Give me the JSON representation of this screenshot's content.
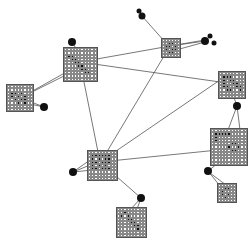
{
  "diagram": {
    "type": "graph-network",
    "background": "#ffffff",
    "edge_color": "#555555",
    "node_fill_on": "#111111",
    "node_fill_off": "#ffffff",
    "nodes": [
      {
        "id": "A",
        "x": 63,
        "y": 47,
        "size": 35,
        "n": 10,
        "pattern": [
          "0000000000",
          "0000000000",
          "0110000000",
          "0011000000",
          "0001100000",
          "0000110000",
          "0000011000",
          "0000001100",
          "0000000000",
          "0000000000"
        ]
      },
      {
        "id": "B",
        "x": 6,
        "y": 84,
        "size": 28,
        "n": 8,
        "pattern": [
          "00000000",
          "00000000",
          "01101000",
          "01010100",
          "00101100",
          "00010100",
          "00000000",
          "00000000"
        ]
      },
      {
        "id": "C",
        "x": 161,
        "y": 38,
        "size": 20,
        "n": 6,
        "pattern": [
          "000000",
          "001100",
          "011010",
          "010110",
          "001100",
          "000000"
        ]
      },
      {
        "id": "D",
        "x": 218,
        "y": 71,
        "size": 28,
        "n": 8,
        "pattern": [
          "00000000",
          "01110000",
          "01011000",
          "01001100",
          "01100110",
          "00110010",
          "00000000",
          "00000000"
        ]
      },
      {
        "id": "E",
        "x": 210,
        "y": 128,
        "size": 38,
        "n": 11,
        "pattern": [
          "00000000000",
          "01111100000",
          "01000000000",
          "01000000000",
          "00000011000",
          "00000100100",
          "00000011000",
          "00000000000",
          "00000000000",
          "00000000000",
          "00000000000"
        ]
      },
      {
        "id": "F",
        "x": 217,
        "y": 183,
        "size": 20,
        "n": 6,
        "pattern": [
          "000000",
          "001100",
          "010000",
          "010100",
          "001000",
          "000000"
        ]
      },
      {
        "id": "G",
        "x": 87,
        "y": 150,
        "size": 31,
        "n": 9,
        "pattern": [
          "000000000",
          "011111100",
          "010101100",
          "011011100",
          "010101000",
          "011011100",
          "000000000",
          "000000000",
          "000000000"
        ]
      },
      {
        "id": "H",
        "x": 116,
        "y": 207,
        "size": 31,
        "n": 9,
        "pattern": [
          "000000000",
          "001000000",
          "010100000",
          "000110000",
          "000011000",
          "000001100",
          "000000100",
          "000000000",
          "000000000"
        ]
      }
    ],
    "dots": [
      {
        "x": 72,
        "y": 42,
        "r": 4
      },
      {
        "x": 44,
        "y": 107,
        "r": 4
      },
      {
        "x": 139,
        "y": 11,
        "r": 2.5
      },
      {
        "x": 142,
        "y": 16,
        "r": 3.5
      },
      {
        "x": 205,
        "y": 41,
        "r": 4
      },
      {
        "x": 210,
        "y": 36,
        "r": 2.5
      },
      {
        "x": 214,
        "y": 43,
        "r": 2.5
      },
      {
        "x": 237,
        "y": 106,
        "r": 4
      },
      {
        "x": 208,
        "y": 171,
        "r": 4
      },
      {
        "x": 73,
        "y": 172,
        "r": 4
      },
      {
        "x": 141,
        "y": 198,
        "r": 4
      }
    ],
    "edges": [
      [
        80,
        62,
        170,
        46
      ],
      [
        80,
        62,
        220,
        82
      ],
      [
        80,
        62,
        100,
        162
      ],
      [
        72,
        42,
        80,
        55
      ],
      [
        20,
        98,
        70,
        70
      ],
      [
        20,
        98,
        64,
        76
      ],
      [
        30,
        104,
        44,
        107
      ],
      [
        26,
        100,
        44,
        107
      ],
      [
        142,
        16,
        165,
        42
      ],
      [
        170,
        46,
        205,
        41
      ],
      [
        176,
        50,
        205,
        42
      ],
      [
        176,
        45,
        205,
        40
      ],
      [
        170,
        46,
        102,
        160
      ],
      [
        100,
        162,
        218,
        150
      ],
      [
        100,
        162,
        220,
        80
      ],
      [
        237,
        106,
        232,
        92
      ],
      [
        237,
        106,
        228,
        130
      ],
      [
        237,
        106,
        240,
        130
      ],
      [
        208,
        171,
        222,
        160
      ],
      [
        208,
        171,
        220,
        186
      ],
      [
        210,
        173,
        226,
        185
      ],
      [
        73,
        172,
        90,
        165
      ],
      [
        73,
        172,
        92,
        170
      ],
      [
        73,
        172,
        90,
        160
      ],
      [
        100,
        162,
        141,
        198
      ],
      [
        141,
        198,
        130,
        210
      ],
      [
        141,
        198,
        136,
        212
      ]
    ]
  }
}
